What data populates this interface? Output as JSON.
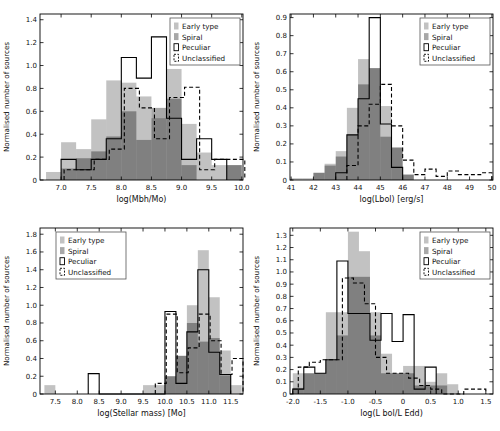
{
  "figure": {
    "background": "#ffffff",
    "axis_color": "#000000",
    "legend_labels": [
      "Early type",
      "Spiral",
      "Peculiar",
      "Unclassified"
    ]
  },
  "chart_data": [
    {
      "type": "bar",
      "subtype": "overlaid-histogram",
      "panel": "top-left",
      "title": "",
      "xlabel": "log(Mbh/Mo)",
      "ylabel": "Normalised number of sources",
      "xlim": [
        6.65,
        10.02
      ],
      "ylim": [
        0,
        1.45
      ],
      "grid": false,
      "xticks": [
        7.0,
        7.5,
        8.0,
        8.5,
        9.0,
        9.5,
        10.0
      ],
      "xtick_labels": [
        "7.0",
        "7.5",
        "8.0",
        "8.5",
        "9.0",
        "9.5",
        "10.0"
      ],
      "yticks": [
        0,
        0.2,
        0.4,
        0.6,
        0.8,
        1.0,
        1.2,
        1.4
      ],
      "ytick_labels": [
        "0",
        "0.2",
        "0.4",
        "0.6",
        "0.8",
        "1.0",
        "1.2",
        "1.4"
      ],
      "legend": {
        "position": "top-right",
        "entries": [
          "Early type",
          "Spiral",
          "Peculiar",
          "Unclassified"
        ]
      },
      "series": [
        {
          "name": "Early type",
          "style": "fill",
          "color": "#000000",
          "alpha": 0.24,
          "start": 6.75,
          "binWidth": 0.25,
          "values": [
            0.07,
            0.33,
            0.27,
            0.53,
            0.87,
            0.85,
            0.73,
            0.54,
            0.97,
            0.49,
            0.24,
            0.13,
            0.13
          ]
        },
        {
          "name": "Spiral",
          "style": "fill",
          "color": "#000000",
          "alpha": 0.34,
          "start": 6.75,
          "binWidth": 0.25,
          "values": [
            0,
            0.1,
            0.19,
            0.25,
            0.38,
            0.6,
            0.35,
            0.63,
            0.71,
            0.13,
            0,
            0,
            0.13
          ]
        },
        {
          "name": "Peculiar",
          "style": "step-solid",
          "color": "#000000",
          "start": 6.75,
          "binWidth": 0.25,
          "values": [
            0,
            0.18,
            0.09,
            0.18,
            0.36,
            1.07,
            0.89,
            1.25,
            0.54,
            0.18,
            0.36,
            0.18,
            0
          ]
        },
        {
          "name": "Unclassified",
          "style": "step-dashed",
          "color": "#000000",
          "start": 6.8,
          "binWidth": 0.25,
          "values": [
            0,
            0.09,
            0.09,
            0.18,
            0.27,
            0.8,
            0.63,
            0.36,
            0.72,
            0.81,
            0.09,
            0.18,
            0.18
          ]
        }
      ]
    },
    {
      "type": "bar",
      "subtype": "overlaid-histogram",
      "panel": "top-right",
      "title": "",
      "xlabel": "log(Lbol) [erg/s]",
      "ylabel": "Normalised number of sources",
      "xlim": [
        40.95,
        50.05
      ],
      "ylim": [
        0,
        0.92
      ],
      "grid": false,
      "xticks": [
        41,
        42,
        43,
        44,
        45,
        46,
        47,
        48,
        49,
        50
      ],
      "xtick_labels": [
        "41",
        "42",
        "43",
        "44",
        "45",
        "46",
        "47",
        "48",
        "49",
        "50"
      ],
      "yticks": [
        0,
        0.1,
        0.2,
        0.3,
        0.4,
        0.5,
        0.6,
        0.7,
        0.8,
        0.9
      ],
      "ytick_labels": [
        "0",
        "0.1",
        "0.2",
        "0.3",
        "0.4",
        "0.5",
        "0.6",
        "0.7",
        "0.8",
        "0.9"
      ],
      "legend": {
        "position": "top-right",
        "entries": [
          "Early type",
          "Spiral",
          "Peculiar",
          "Unclassified"
        ]
      },
      "series": [
        {
          "name": "Early type",
          "style": "fill",
          "color": "#000000",
          "alpha": 0.24,
          "start": 41,
          "binWidth": 0.5,
          "values": [
            0.01,
            0.01,
            0.04,
            0.09,
            0.16,
            0.4,
            0.67,
            0.62,
            0.41,
            0.18,
            0.03,
            0,
            0,
            0,
            0,
            0,
            0,
            0
          ]
        },
        {
          "name": "Spiral",
          "style": "fill",
          "color": "#000000",
          "alpha": 0.34,
          "start": 41,
          "binWidth": 0.5,
          "values": [
            0,
            0,
            0.04,
            0.08,
            0.13,
            0.25,
            0.53,
            0.62,
            0.24,
            0.18,
            0.03,
            0,
            0,
            0,
            0,
            0,
            0,
            0
          ]
        },
        {
          "name": "Peculiar",
          "style": "step-solid",
          "color": "#000000",
          "start": 41,
          "binWidth": 0.5,
          "values": [
            0,
            0,
            0,
            0,
            0.04,
            0.25,
            0.45,
            0.9,
            0.31,
            0.07,
            0,
            0,
            0,
            0,
            0,
            0,
            0,
            0
          ]
        },
        {
          "name": "Unclassified",
          "style": "step-dashed",
          "color": "#000000",
          "start": 41,
          "binWidth": 0.5,
          "values": [
            0,
            0,
            0,
            0,
            0,
            0.08,
            0.3,
            0.42,
            0.53,
            0.3,
            0.11,
            0.03,
            0.06,
            0.02,
            0.05,
            0.03,
            0.03,
            0.04
          ]
        }
      ]
    },
    {
      "type": "bar",
      "subtype": "overlaid-histogram",
      "panel": "bottom-left",
      "title": "",
      "xlabel": "log(Stellar mass) [Mo]",
      "ylabel": "Normalised number of sources",
      "xlim": [
        7.15,
        11.78
      ],
      "ylim": [
        0,
        1.87
      ],
      "grid": false,
      "xticks": [
        7.5,
        8.0,
        8.5,
        9.0,
        9.5,
        10.0,
        10.5,
        11.0,
        11.5
      ],
      "xtick_labels": [
        "7.5",
        "8.0",
        "8.5",
        "9.0",
        "9.5",
        "10.0",
        "10.5",
        "11.0",
        "11.5"
      ],
      "yticks": [
        0,
        0.2,
        0.4,
        0.6,
        0.8,
        1.0,
        1.2,
        1.4,
        1.6,
        1.8
      ],
      "ytick_labels": [
        "0",
        "0.2",
        "0.4",
        "0.6",
        "0.8",
        "1.0",
        "1.2",
        "1.4",
        "1.6",
        "1.8"
      ],
      "legend": {
        "position": "top-left",
        "entries": [
          "Early type",
          "Spiral",
          "Peculiar",
          "Unclassified"
        ]
      },
      "series": [
        {
          "name": "Early type",
          "style": "fill",
          "color": "#000000",
          "alpha": 0.24,
          "start": 7.25,
          "binWidth": 0.25,
          "values": [
            0.1,
            0,
            0,
            0,
            0,
            0,
            0,
            0,
            0,
            0.1,
            0.1,
            0.2,
            0.43,
            1.0,
            1.62,
            1.09,
            0.49,
            0.1
          ]
        },
        {
          "name": "Spiral",
          "style": "fill",
          "color": "#000000",
          "alpha": 0.34,
          "start": 7.25,
          "binWidth": 0.25,
          "values": [
            0,
            0,
            0,
            0,
            0,
            0,
            0,
            0,
            0,
            0,
            0,
            0.2,
            0.43,
            0.8,
            0.59,
            0.63,
            0.21,
            0
          ]
        },
        {
          "name": "Peculiar",
          "style": "step-solid",
          "color": "#000000",
          "start": 7.25,
          "binWidth": 0.25,
          "values": [
            0,
            0,
            0,
            0,
            0.23,
            0,
            0,
            0,
            0,
            0,
            0,
            0.93,
            0.12,
            0.7,
            1.4,
            0.47,
            0.22,
            0
          ]
        },
        {
          "name": "Unclassified",
          "style": "step-dashed",
          "color": "#000000",
          "start": 7.28,
          "binWidth": 0.25,
          "values": [
            0,
            0,
            0,
            0,
            0,
            0,
            0,
            0,
            0,
            0,
            0.12,
            0.9,
            0.24,
            0.52,
            0.9,
            0.6,
            0.22,
            0.4
          ]
        }
      ]
    },
    {
      "type": "bar",
      "subtype": "overlaid-histogram",
      "panel": "bottom-right",
      "title": "",
      "xlabel": "log(L bol/L Edd)",
      "ylabel": "Normalised number of sources",
      "xlim": [
        -2.05,
        1.63
      ],
      "ylim": [
        0,
        1.36
      ],
      "grid": false,
      "xticks": [
        -2.0,
        -1.5,
        -1.0,
        -0.5,
        0,
        0.5,
        1.0,
        1.5
      ],
      "xtick_labels": [
        "-2.0",
        "-1.5",
        "-1.0",
        "-0.5",
        "0",
        "0.5",
        "1.0",
        "1.5"
      ],
      "yticks": [
        0,
        0.1,
        0.2,
        0.3,
        0.4,
        0.5,
        0.6,
        0.7,
        0.8,
        0.9,
        1.0,
        1.1,
        1.2,
        1.3
      ],
      "ytick_labels": [
        "0",
        "0.1",
        "0.2",
        "0.3",
        "0.4",
        "0.5",
        "0.6",
        "0.7",
        "0.8",
        "0.9",
        "1.0",
        "1.1",
        "1.2",
        "1.3"
      ],
      "legend": {
        "position": "top-right",
        "entries": [
          "Early type",
          "Spiral",
          "Peculiar",
          "Unclassified"
        ]
      },
      "series": [
        {
          "name": "Early type",
          "style": "fill",
          "color": "#000000",
          "alpha": 0.24,
          "start": -2.0,
          "binWidth": 0.2,
          "values": [
            0.17,
            0.17,
            0.17,
            0.67,
            0.67,
            1.33,
            1.17,
            0.67,
            0.33,
            0.17,
            0.23,
            0.23,
            0.1,
            0.17,
            0.08
          ]
        },
        {
          "name": "Spiral",
          "style": "fill",
          "color": "#000000",
          "alpha": 0.34,
          "start": -2.0,
          "binWidth": 0.2,
          "values": [
            0.05,
            0.17,
            0.17,
            0.28,
            0.48,
            0.96,
            0.96,
            0.48,
            0.17,
            0.17,
            0.17,
            0.07,
            0.07,
            0.07,
            0
          ]
        },
        {
          "name": "Peculiar",
          "style": "step-solid",
          "color": "#000000",
          "start": -2.0,
          "binWidth": 0.2,
          "values": [
            0.04,
            0.22,
            0.17,
            0.28,
            1.09,
            0.66,
            0.66,
            0.44,
            0.66,
            0.43,
            0.65,
            0.04,
            0.22,
            0,
            0
          ]
        },
        {
          "name": "Unclassified",
          "style": "step-dashed",
          "color": "#000000",
          "start": -1.9,
          "binWidth": 0.2,
          "values": [
            0.22,
            0.26,
            0.28,
            0.28,
            0.95,
            0.91,
            0.74,
            0.3,
            0.17,
            0.17,
            0.13,
            0.07,
            0.04,
            0,
            0,
            0.04,
            0.04
          ]
        }
      ]
    }
  ]
}
